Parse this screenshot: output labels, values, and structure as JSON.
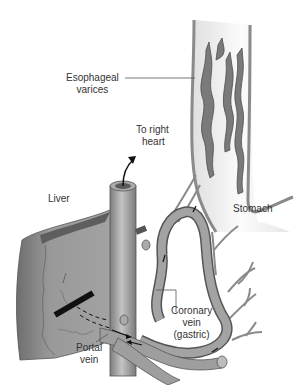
{
  "diagram": {
    "type": "anatomical illustration",
    "colors": {
      "vessel_fill": "#9a9a9a",
      "vessel_stroke": "#555555",
      "liver_fill": "#8f8f8f",
      "liver_dark": "#6a6a6a",
      "esophagus_fill": "#f2f2f2",
      "varix_fill": "#7a7a7a",
      "text": "#333333",
      "obstruction_bar": "#111111"
    },
    "labels": {
      "esophageal_varices": [
        "Esophageal",
        "varices"
      ],
      "to_right_heart": [
        "To right",
        "heart"
      ],
      "liver": "Liver",
      "stomach": "Stomach",
      "coronary_vein": [
        "Coronary",
        "vein",
        "(gastric)"
      ],
      "portal_vein": [
        "Portal",
        "vein"
      ]
    }
  }
}
